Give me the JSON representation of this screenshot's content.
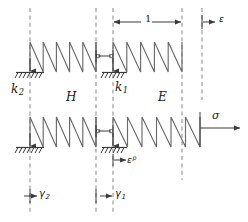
{
  "figure": {
    "background_color": "#ffffff",
    "line_color": "#444444",
    "dashed_color": "#b8b8b8",
    "text_color": "#1a1a1a",
    "width": 248,
    "height": 222
  },
  "labels": {
    "spring_k2": "k",
    "spring_k2_sub": "2",
    "spring_k1": "k",
    "spring_k1_sub": "1",
    "modulus_H": "H",
    "modulus_E": "E",
    "strain_eps": "ε",
    "stress_sigma": "σ",
    "plastic_strain": "ε",
    "plastic_strain_sup": "p",
    "gamma2": "γ",
    "gamma2_sub": "2",
    "gamma1": "γ",
    "gamma1_sub": "1",
    "dimension_1": "1"
  },
  "elements": {
    "springs": [
      {
        "name": "top-left-spring-H",
        "x1": 30,
        "x2": 96,
        "y_top": 42,
        "y_bottom": 72,
        "coils": 5
      },
      {
        "name": "top-right-spring-E",
        "x1": 113,
        "x2": 182,
        "y_top": 42,
        "y_bottom": 72,
        "coils": 5
      },
      {
        "name": "bottom-left-spring-H",
        "x1": 30,
        "x2": 96,
        "y_top": 117,
        "y_bottom": 147,
        "coils": 5
      },
      {
        "name": "bottom-right-spring-E",
        "x1": 113,
        "x2": 200,
        "y_top": 117,
        "y_bottom": 147,
        "coils": 6
      }
    ],
    "ground_supports": [
      {
        "name": "ground-support-top-left",
        "x": 30,
        "y": 72
      },
      {
        "name": "ground-support-top-middle",
        "x": 113,
        "y": 72
      },
      {
        "name": "ground-support-bottom-left",
        "x": 30,
        "y": 147
      },
      {
        "name": "ground-support-bottom-middle",
        "x": 113,
        "y": 147
      }
    ],
    "sliders": [
      {
        "name": "slider-top",
        "x1": 96,
        "x2": 113,
        "y": 56
      },
      {
        "name": "slider-bottom",
        "x1": 96,
        "x2": 113,
        "y": 131
      }
    ],
    "dashed_verticals": [
      {
        "name": "dashed-line-k2-axis",
        "x": 30,
        "y1": 8,
        "y2": 214
      },
      {
        "name": "dashed-line-H-right",
        "x": 96,
        "y1": 8,
        "y2": 214
      },
      {
        "name": "dashed-line-k1-axis",
        "x": 113,
        "y1": 8,
        "y2": 214
      },
      {
        "name": "dashed-line-E-right",
        "x": 182,
        "y1": 8,
        "y2": 180
      },
      {
        "name": "dashed-line-eps-axis",
        "x": 202,
        "y1": 8,
        "y2": 100
      }
    ],
    "dimension": {
      "name": "dimension-1",
      "x1": 113,
      "x2": 182,
      "y": 22
    },
    "arrows": {
      "eps": {
        "x1": 202,
        "x2": 215,
        "y": 22
      },
      "sigma": {
        "x1": 200,
        "x2": 240,
        "y": 128
      },
      "eps_p": {
        "x1": 115,
        "x2": 126,
        "y": 160
      },
      "gamma2": {
        "x1": 24,
        "x2": 37,
        "y": 196
      },
      "gamma1": {
        "x1": 100,
        "x2": 113,
        "y": 196
      }
    }
  }
}
